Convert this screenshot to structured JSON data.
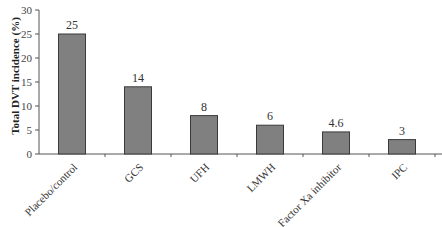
{
  "chart_data": {
    "type": "bar",
    "title": "",
    "xlabel": "",
    "ylabel": "Total DVT incidence (%)",
    "ylim": [
      0,
      30
    ],
    "yticks": [
      0,
      5,
      10,
      15,
      20,
      25,
      30
    ],
    "grid": false,
    "legend": null,
    "categories": [
      "Placebo/control",
      "GCS",
      "UFH",
      "LMWH",
      "Factor Xa inhibitor",
      "IPC"
    ],
    "values": [
      25,
      14,
      8,
      6,
      4.6,
      3
    ],
    "data_labels": [
      "25",
      "14",
      "8",
      "6",
      "4.6",
      "3"
    ],
    "bar_color": "#808080",
    "bar_edge_color": "#3a3a3a"
  },
  "caption_fragment": ""
}
